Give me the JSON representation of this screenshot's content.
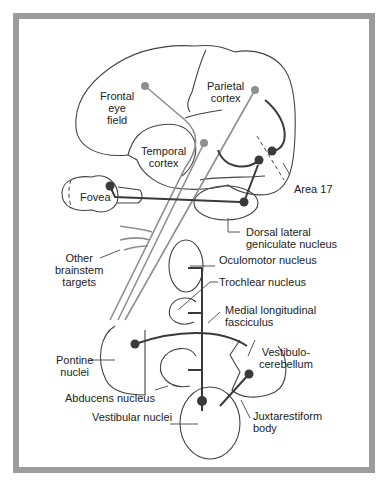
{
  "figure": {
    "colors": {
      "frame": "#9c9c9c",
      "cortical_pathway": "#8f8f8f",
      "subcortical_pathway": "#3a3a3a",
      "outline": "#444444"
    }
  },
  "labels": {
    "frontal_eye_field": [
      "Frontal",
      "eye",
      "field"
    ],
    "parietal_cortex": [
      "Parietal",
      "cortex"
    ],
    "temporal_cortex": [
      "Temporal",
      "cortex"
    ],
    "area_17": "Area 17",
    "fovea": "Fovea",
    "dorsal_lateral_geniculate": [
      "Dorsal lateral",
      "geniculate nucleus"
    ],
    "other_brainstem_targets": [
      "Other",
      "brainstem",
      "targets"
    ],
    "oculomotor_nucleus": "Oculomotor nucleus",
    "trochlear_nucleus": "Trochlear nucleus",
    "medial_longitudinal_fasciculus": [
      "Medial longitudinal",
      "fasciculus"
    ],
    "pontine_nuclei": [
      "Pontine",
      "nuclei"
    ],
    "vestibulocerebellum": [
      "Vestibulo-",
      "cerebellum"
    ],
    "abducens_nucleus": "Abducens nucleus",
    "vestibular_nuclei": "Vestibular nuclei",
    "juxtarestiform_body": [
      "Juxtarestiform",
      "body"
    ]
  }
}
